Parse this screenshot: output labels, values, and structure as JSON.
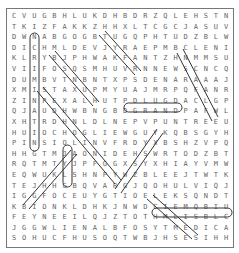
{
  "puzzle": {
    "cols": 22,
    "rows": 22,
    "grid": [
      "CVUGBHLUKDHBDRZQLEHSTN",
      "TKIZFAKKZHHXLTCGCJASUV",
      "DWNABGOGBTUGQPHTUDZBLW",
      "DICHMLDEVJYRAEPMBCLENI",
      "KLRYBJPHWAKFANTZHNMMSU",
      "VIIFOSQSMHUVRNNEWSCNCQ",
      "DUMBVTNBNTXPSDENARAAAJ",
      "XMISTAXUPMYUAJMRPQFANR",
      "ZINPEXALHUTPDLUGDACLGP",
      "QJAUDHWBNGBDGRANDPAFWL",
      "XHTRDHNLDLNEPVPUNTREEU",
      "HUIOCHOGLIEWGUYKQBSGYH",
      "PINSIQLINVFRDYXBSHZVPQ",
      "HHGTMJAONIDEHSWRTODZBT",
      "RQTMTYJPFGGXSYXHIAYVMW",
      "EQWUKLSHNPYWZBLEEJTWTK",
      "TEJHHGBQVARGJQOHULVIQJ",
      "IGGFOCEUYGTIOELEKSQNDT",
      "KBIONKLDHKJNWDCIEMQBIU",
      "FEYNEEILQJZTOTHMLISBLC",
      "JGGWLIENALBFOSYTMEDICA",
      "SOHUCFHUSOQTWBJHSESIHH"
    ],
    "found_words": [
      "INCRIMINATING",
      "GRANDPA",
      "MEDICATION",
      "BELIEVE",
      "STUMBLE",
      "GRANDSON",
      "CANDLE",
      "DEATH",
      "LENS"
    ]
  }
}
